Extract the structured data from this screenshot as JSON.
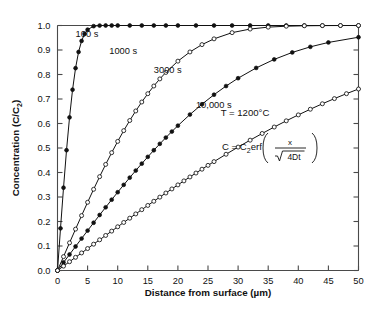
{
  "chart_data": {
    "type": "line",
    "title": "",
    "xlabel": "Distance from surface (µm)",
    "ylabel": "Concentration (C/C₂)",
    "xlim": [
      0,
      50
    ],
    "ylim": [
      0,
      1.0
    ],
    "xticks": [
      0,
      5,
      10,
      15,
      20,
      25,
      30,
      35,
      40,
      45,
      50
    ],
    "xticklabels": [
      "0",
      "5",
      "10",
      "15",
      "20",
      "25",
      "30",
      "35",
      "40",
      "45",
      "50"
    ],
    "yticks": [
      0.0,
      0.1,
      0.2,
      0.3,
      0.4,
      0.5,
      0.6,
      0.7,
      0.8,
      0.9,
      1.0
    ],
    "yticklabels": [
      "0.0",
      "0.1",
      "0.2",
      "0.3",
      "0.4",
      "0.5",
      "0.6",
      "0.7",
      "0.8",
      "0.9",
      "1.0"
    ],
    "grid": false,
    "legend": "inline-curve-labels",
    "annotations": [
      {
        "name": "temperature",
        "text": "T = 1200°C",
        "x": 25.5,
        "y": 0.66
      },
      {
        "name": "equation",
        "text": "C = C₂erf( x / √(4Dt) )",
        "x": 24.0,
        "y": 0.545
      }
    ],
    "series": [
      {
        "name": "100 s",
        "label": "100 s",
        "marker": "filled-circle",
        "label_x": 3.0,
        "label_y": 0.955,
        "x": [
          0,
          0.5,
          1.0,
          1.5,
          2.0,
          2.5,
          3.0,
          3.5,
          4.0,
          4.5,
          5.0,
          6.0,
          7.0,
          8.0,
          9.0,
          10.0,
          12.0,
          14.0,
          16.0,
          18.0,
          20.0,
          23.0,
          26.0,
          29.0,
          32.0,
          35.0,
          38.0,
          41.0,
          44.0,
          47.0,
          50.0
        ],
        "y": [
          0.0,
          0.172,
          0.338,
          0.491,
          0.625,
          0.738,
          0.826,
          0.892,
          0.937,
          0.966,
          0.983,
          0.9973,
          0.99975,
          0.99999,
          1.0,
          1.0,
          1.0,
          1.0,
          1.0,
          1.0,
          1.0,
          1.0,
          1.0,
          1.0,
          1.0,
          1.0,
          1.0,
          1.0,
          1.0,
          1.0,
          1.0
        ]
      },
      {
        "name": "1000 s",
        "label": "1000 s",
        "marker": "open-circle",
        "label_x": 8.6,
        "label_y": 0.885,
        "x": [
          0,
          1,
          2,
          3,
          4,
          5,
          6,
          7,
          8,
          9,
          10,
          11,
          12,
          13,
          14,
          15,
          16,
          17,
          18,
          20,
          22,
          24,
          26,
          29,
          32,
          35,
          38,
          41,
          44,
          47,
          50
        ],
        "y": [
          0.0,
          0.0566,
          0.113,
          0.1689,
          0.2241,
          0.2784,
          0.3314,
          0.383,
          0.433,
          0.481,
          0.527,
          0.5708,
          0.6122,
          0.6512,
          0.6877,
          0.7216,
          0.753,
          0.782,
          0.8085,
          0.8545,
          0.892,
          0.922,
          0.9455,
          0.9708,
          0.9855,
          0.9933,
          0.9971,
          0.9988,
          0.99957,
          0.99986,
          0.99996
        ]
      },
      {
        "name": "3000 s",
        "label": "3000 s",
        "marker": "filled-circle",
        "label_x": 16.0,
        "label_y": 0.808,
        "x": [
          0,
          1,
          2,
          3,
          4,
          5,
          6,
          7,
          8,
          9,
          10,
          11,
          12,
          13,
          14,
          15,
          16,
          17,
          18,
          19,
          20,
          22,
          24,
          26,
          28,
          30,
          33,
          36,
          39,
          42,
          45,
          50
        ],
        "y": [
          0.0,
          0.0327,
          0.0654,
          0.098,
          0.1305,
          0.1628,
          0.1949,
          0.2266,
          0.258,
          0.289,
          0.3195,
          0.3495,
          0.379,
          0.4079,
          0.4362,
          0.4638,
          0.4908,
          0.517,
          0.5425,
          0.5672,
          0.5912,
          0.6366,
          0.6787,
          0.7175,
          0.7529,
          0.7849,
          0.8268,
          0.8617,
          0.8901,
          0.9129,
          0.9308,
          0.9521
        ]
      },
      {
        "name": "10,000 s",
        "label": "10,000 s",
        "marker": "open-circle",
        "label_x": 23.0,
        "label_y": 0.662,
        "x": [
          0,
          1,
          2,
          3,
          4,
          5,
          6,
          7,
          8,
          9,
          10,
          11,
          12,
          13,
          14,
          15,
          16,
          17,
          18,
          19,
          20,
          21,
          22,
          23,
          24,
          25,
          26,
          28,
          30,
          32,
          34,
          36,
          38,
          40,
          42,
          44,
          46,
          48,
          50
        ],
        "y": [
          0.0,
          0.0179,
          0.0359,
          0.0538,
          0.0717,
          0.0896,
          0.1075,
          0.1253,
          0.1431,
          0.1608,
          0.1785,
          0.1961,
          0.2136,
          0.231,
          0.2483,
          0.2655,
          0.2826,
          0.2995,
          0.3163,
          0.3329,
          0.3494,
          0.3657,
          0.3818,
          0.3978,
          0.4135,
          0.4291,
          0.4444,
          0.4745,
          0.5037,
          0.532,
          0.5593,
          0.5856,
          0.6109,
          0.6351,
          0.6583,
          0.6805,
          0.7016,
          0.7217,
          0.7408
        ]
      }
    ]
  },
  "annotations_text": {
    "temperature": "T = 1200°C",
    "equation_lhs": "C = C",
    "equation_sub": "2",
    "equation_erf": "erf",
    "equation_num": "x",
    "equation_den": "4Dt"
  },
  "axes": {
    "x_title": "Distance from surface (µm)",
    "y_title_main": "Concentration (C/C",
    "y_title_sub": "2",
    "y_title_end": ")"
  }
}
